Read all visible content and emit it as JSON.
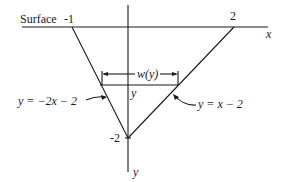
{
  "diagram": {
    "surface_label": "Surface",
    "x_axis_label": "x",
    "y_axis_label": "y",
    "tick_left": "-1",
    "tick_right": "2",
    "tick_bottom": "-2",
    "width_label": "w(y)",
    "level_label": "y",
    "left_line_eq": "y = −2x − 2",
    "right_line_eq": "y = x − 2"
  }
}
